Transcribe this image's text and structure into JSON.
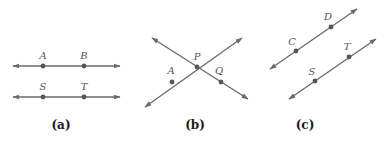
{
  "figure": {
    "panels": [
      {
        "caption": "(a)",
        "description": "two parallel horizontal lines",
        "lines": [
          {
            "points": [
              {
                "label": "A"
              },
              {
                "label": "B"
              }
            ]
          },
          {
            "points": [
              {
                "label": "S"
              },
              {
                "label": "T"
              }
            ]
          }
        ]
      },
      {
        "caption": "(b)",
        "description": "two intersecting lines",
        "points": [
          {
            "label": "P"
          },
          {
            "label": "A"
          },
          {
            "label": "Q"
          }
        ]
      },
      {
        "caption": "(c)",
        "description": "two parallel slanted lines",
        "lines": [
          {
            "points": [
              {
                "label": "C"
              },
              {
                "label": "D"
              }
            ]
          },
          {
            "points": [
              {
                "label": "S"
              },
              {
                "label": "T"
              }
            ]
          }
        ]
      }
    ]
  },
  "colors": {
    "line": "#6a6a6a",
    "point": "#555555",
    "label": "#555555",
    "caption": "#1a1a1a"
  }
}
